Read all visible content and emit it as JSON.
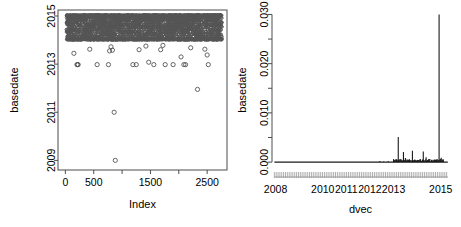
{
  "figure": {
    "title": "",
    "background": "#ffffff",
    "panels": 2
  },
  "chart_data": [
    {
      "type": "scatter",
      "id": "left-panel",
      "title": "",
      "xlabel": "Index",
      "ylabel": "basedate",
      "xlim": [
        -130,
        2850
      ],
      "ylim": [
        2008.6,
        2015.25
      ],
      "xticks": [
        0,
        500,
        1000,
        1500,
        2000,
        2500
      ],
      "xticklabels": [
        "0",
        "500",
        "",
        "1500",
        "",
        "2500"
      ],
      "yticks": [
        2009,
        2011,
        2013,
        2015
      ],
      "yticklabels": [
        "2009",
        "2011",
        "2013",
        "2015"
      ],
      "grid": false,
      "legend": null,
      "marker": "open-circle",
      "marker_color": "#555555",
      "frame": "box",
      "description": "Dense band of open circles between 2014.0 and 2015.05 spanning the full index range, plus scattered low outliers.",
      "dense_band": {
        "y_min": 2013.98,
        "y_max": 2015.05,
        "x_min": 20,
        "x_max": 2760,
        "n_points": 2400
      },
      "outliers": [
        {
          "x": 150,
          "y": 2013.45
        },
        {
          "x": 205,
          "y": 2012.98
        },
        {
          "x": 215,
          "y": 2012.98
        },
        {
          "x": 225,
          "y": 2012.98
        },
        {
          "x": 430,
          "y": 2013.62
        },
        {
          "x": 560,
          "y": 2012.98
        },
        {
          "x": 760,
          "y": 2012.98
        },
        {
          "x": 780,
          "y": 2013.55
        },
        {
          "x": 805,
          "y": 2013.72
        },
        {
          "x": 830,
          "y": 2013.58
        },
        {
          "x": 860,
          "y": 2011.0
        },
        {
          "x": 880,
          "y": 2009.0
        },
        {
          "x": 1190,
          "y": 2012.98
        },
        {
          "x": 1250,
          "y": 2012.98
        },
        {
          "x": 1300,
          "y": 2013.6
        },
        {
          "x": 1420,
          "y": 2013.75
        },
        {
          "x": 1470,
          "y": 2013.08
        },
        {
          "x": 1560,
          "y": 2012.98
        },
        {
          "x": 1680,
          "y": 2013.6
        },
        {
          "x": 1720,
          "y": 2013.78
        },
        {
          "x": 1760,
          "y": 2012.98
        },
        {
          "x": 1900,
          "y": 2012.98
        },
        {
          "x": 2040,
          "y": 2013.3
        },
        {
          "x": 2090,
          "y": 2012.98
        },
        {
          "x": 2120,
          "y": 2012.98
        },
        {
          "x": 2210,
          "y": 2013.68
        },
        {
          "x": 2330,
          "y": 2011.95
        },
        {
          "x": 2460,
          "y": 2013.62
        },
        {
          "x": 2500,
          "y": 2013.38
        },
        {
          "x": 2520,
          "y": 2012.98
        }
      ]
    },
    {
      "type": "line",
      "id": "right-panel",
      "title": "",
      "xlabel": "dvec",
      "ylabel": "basedate",
      "xlim": [
        2007.85,
        2015.35
      ],
      "ylim": [
        -0.0012,
        0.0305
      ],
      "xticks": [
        2008,
        2010,
        2011,
        2012,
        2013,
        2015
      ],
      "xticklabels": [
        "2008",
        "2010",
        "2011",
        "2012",
        "2013",
        "2015"
      ],
      "yticks": [
        0.0,
        0.005,
        0.01,
        0.015,
        0.02,
        0.025,
        0.03
      ],
      "yticklabels": [
        "0.000",
        "",
        "0.010",
        "",
        "0.020",
        "",
        "0.030"
      ],
      "grid": false,
      "legend": null,
      "line_color": "#1a1a1a",
      "rug": true,
      "description": "Density-like spike plot, near zero until 2013 then several spikes; tallest spike 0.0300 at 2014.93.",
      "spikes": [
        {
          "x": 2012.42,
          "y": 0.00022
        },
        {
          "x": 2012.58,
          "y": 0.00012
        },
        {
          "x": 2012.78,
          "y": 0.00015
        },
        {
          "x": 2013.04,
          "y": 0.00035
        },
        {
          "x": 2013.12,
          "y": 0.0005
        },
        {
          "x": 2013.2,
          "y": 0.00512
        },
        {
          "x": 2013.27,
          "y": 0.0006
        },
        {
          "x": 2013.34,
          "y": 0.0004
        },
        {
          "x": 2013.42,
          "y": 0.00205
        },
        {
          "x": 2013.5,
          "y": 0.00085
        },
        {
          "x": 2013.58,
          "y": 0.00055
        },
        {
          "x": 2013.68,
          "y": 0.00045
        },
        {
          "x": 2013.8,
          "y": 0.0023
        },
        {
          "x": 2013.9,
          "y": 0.00055
        },
        {
          "x": 2014.02,
          "y": 0.0004
        },
        {
          "x": 2014.14,
          "y": 0.0006
        },
        {
          "x": 2014.26,
          "y": 0.00215
        },
        {
          "x": 2014.38,
          "y": 0.001
        },
        {
          "x": 2014.5,
          "y": 0.00065
        },
        {
          "x": 2014.62,
          "y": 0.00045
        },
        {
          "x": 2014.74,
          "y": 0.00055
        },
        {
          "x": 2014.93,
          "y": 0.03
        },
        {
          "x": 2015.02,
          "y": 0.0009
        },
        {
          "x": 2015.1,
          "y": 0.0006
        }
      ],
      "baseline": 0.0
    }
  ]
}
